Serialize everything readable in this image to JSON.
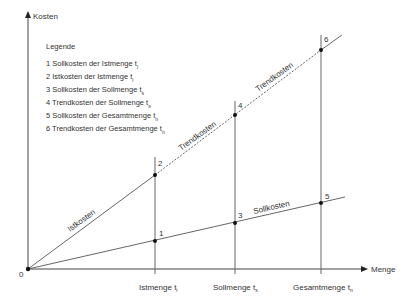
{
  "axes": {
    "y_label": "Kosten",
    "x_label": "Menge",
    "origin_label": "0"
  },
  "x_ticks": [
    {
      "label": "Istmenge t",
      "sub": "i"
    },
    {
      "label": "Sollmenge t",
      "sub": "s"
    },
    {
      "label": "Gesamtmenge t",
      "sub": "n"
    }
  ],
  "legend": {
    "title": "Legende",
    "items": [
      {
        "text": "1 Sollkosten der Istmenge t",
        "sub": "i"
      },
      {
        "text": "2 Istkosten der Istmenge t",
        "sub": "i"
      },
      {
        "text": "3 Sollkosten der Sollmenge t",
        "sub": "s"
      },
      {
        "text": "4 Trendkosten der Sollmenge t",
        "sub": "s"
      },
      {
        "text": "5 Sollkosten der Gesamtmenge t",
        "sub": "n"
      },
      {
        "text": "6 Trendkosten der Gesamtmenge t",
        "sub": "n"
      }
    ]
  },
  "line_labels": {
    "istkosten": "Istkosten",
    "trendkosten_1": "Trendkosten",
    "trendkosten_2": "Trendkosten",
    "sollkosten": "Sollkosten"
  },
  "points": {
    "p1": "1",
    "p2": "2",
    "p3": "3",
    "p4": "4",
    "p5": "5",
    "p6": "6"
  },
  "colors": {
    "line": "#555555",
    "point": "#111111"
  }
}
